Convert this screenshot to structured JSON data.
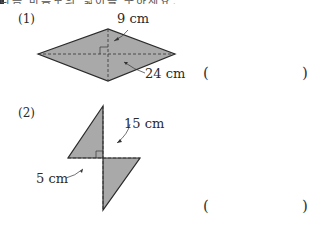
{
  "header": {
    "cut_off_text": "다음 마름모의 넓이를 구하세요."
  },
  "problems": [
    {
      "number": "(1)",
      "shape": "rhombus",
      "measurements": [
        "9 cm",
        "24 cm"
      ],
      "answer_open": "(",
      "answer_close": ")"
    },
    {
      "number": "(2)",
      "shape": "rhombus",
      "measurements": [
        "15 cm",
        "5 cm"
      ],
      "answer_open": "(",
      "answer_close": ")"
    }
  ],
  "colors": {
    "fill": "#a9a9a9",
    "stroke": "#2a2a2a"
  }
}
